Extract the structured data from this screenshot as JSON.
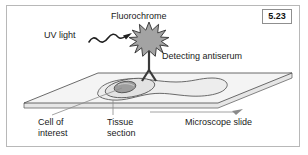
{
  "figure": {
    "number": "5.23",
    "labels": {
      "fluorochrome": "Fluorochrome",
      "uv_light": "UV light",
      "detecting_antiserum": "Detecting antiserum",
      "microscope_slide": "Microscope slide",
      "cell_of": "Cell of",
      "cell_interest": "interest",
      "tissue": "Tissue",
      "tissue_section": "section"
    },
    "colors": {
      "frame_border": "#b8b8b8",
      "text": "#1a1a1a",
      "slide_top": "#f2f2f2",
      "slide_edge": "#e3e3e3",
      "outline": "#555555",
      "star_fill": "#a0a0a0",
      "star_outline": "#4a4a4a",
      "tissue_fill": "#ededed",
      "cell_fill": "#e0e0e0",
      "nucleus_fill": "#9a9a9a",
      "antibody": "#3a3a3a",
      "leader_line": "#777777"
    },
    "elements": {
      "starburst_points": "12",
      "wave_oscillations": "3",
      "antibody_shape": "Y"
    }
  }
}
